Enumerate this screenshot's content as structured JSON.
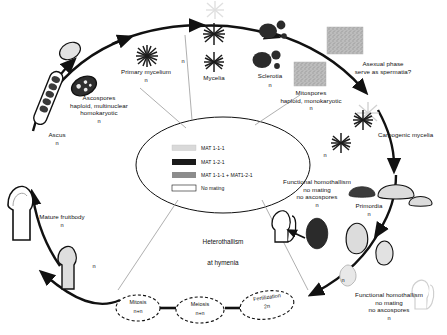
{
  "figure": {
    "type": "fungal-life-cycle-diagram",
    "center_text": {
      "line1": "Heterothallism",
      "line2": "at hymenia"
    }
  },
  "legend": {
    "items": [
      {
        "label": "MAT 1-1-1",
        "swatch": "#d9d9d9"
      },
      {
        "label": "MAT 1-2-1",
        "swatch": "#1a1a1a"
      },
      {
        "label": "MAT 1-1-1 + MAT1-2-1",
        "swatch": "#8c8c8c"
      },
      {
        "label": "No mating",
        "swatch": "#ffffff"
      }
    ]
  },
  "labels": {
    "ascospores": "Ascospores\nhaploid, multinuclear\nhomokaryotic",
    "ascospores_n": "n",
    "primary_mycelium": "Primary mycelium",
    "primary_mycelium_n": "n",
    "mycelia": "Mycelia",
    "mycelia_n": "n",
    "sclerotia": "Sclerotia",
    "sclerotia_n": "n",
    "mitospores": "Mitospores\nhaploid, monokaryotic",
    "mitospores_n": "n",
    "asexual_phase": "Asexual phase\nserve as spermatia?",
    "carpogenic_mycelia": "Carpogenic mycelia",
    "carpogenic_mycelia_n": "n",
    "primordia": "Primordia",
    "primordia_n": "n",
    "functional_homothallism_right": "Functional homothallism\nno mating\nno ascospores",
    "functional_homothallism_right_n": "n",
    "functional_homothallism_center": "Functional homothallism\nno mating\nno ascospores",
    "functional_homothallism_center_n": "n",
    "ascus": "Ascus",
    "ascus_n": "n",
    "mature_fruitbody": "Mature fruitbody",
    "mature_fruitbody_n": "n",
    "young_fruitbody_n": "n",
    "lower_right_n": "n"
  },
  "stages": [
    {
      "name": "Mitosis",
      "ploidy": "n+n"
    },
    {
      "name": "Meiosis",
      "ploidy": "n+n"
    },
    {
      "name": "Fertilization",
      "ploidy": "2n"
    }
  ],
  "colors": {
    "stroke": "#111111",
    "dark_fill": "#3a3a3a",
    "light_fill": "#dedede",
    "mid_fill": "#8c8c8c",
    "background": "#ffffff"
  }
}
